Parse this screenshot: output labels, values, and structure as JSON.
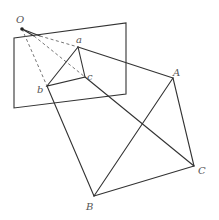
{
  "diagram": {
    "type": "projection-geometry",
    "colors": {
      "line": "#333333",
      "dashed": "#666666",
      "label": "#555555",
      "background": "#ffffff"
    },
    "labels": {
      "O": "O",
      "a": "a",
      "b": "b",
      "c": "c",
      "A": "A",
      "B": "B",
      "C": "C"
    },
    "points": {
      "O": [
        22,
        29
      ],
      "a": [
        78,
        47
      ],
      "b": [
        47,
        86
      ],
      "c": [
        85,
        77
      ],
      "A": [
        173,
        78
      ],
      "B": [
        94,
        196
      ],
      "C": [
        194,
        166
      ]
    },
    "plane": [
      [
        14,
        38
      ],
      [
        126,
        23
      ],
      [
        126,
        94
      ],
      [
        14,
        108
      ]
    ]
  }
}
